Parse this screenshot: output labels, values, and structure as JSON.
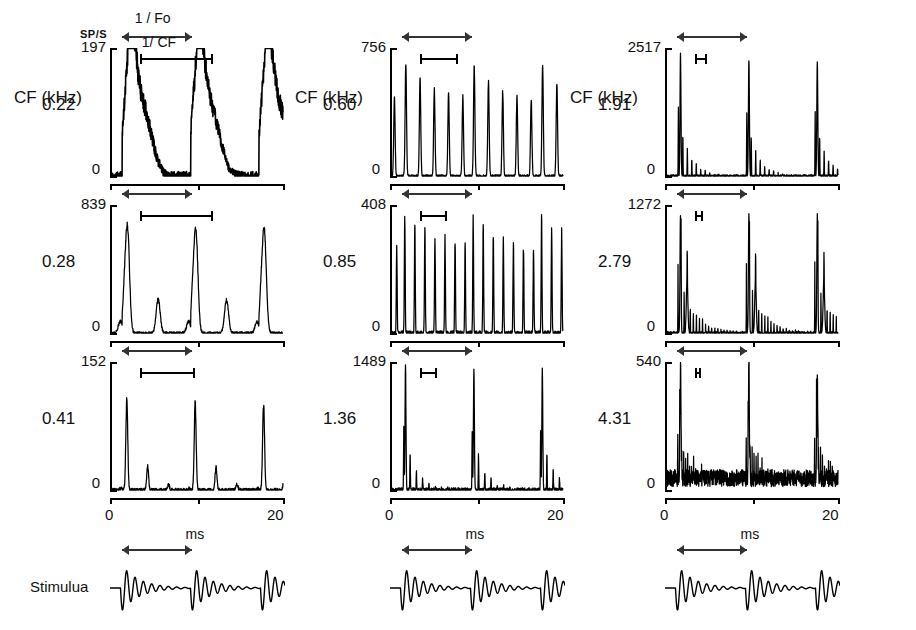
{
  "figure": {
    "yaxis_unit": "SP/S",
    "xaxis_unit": "ms",
    "xticks": [
      "0",
      "20"
    ],
    "xrange": [
      0,
      20
    ],
    "column_header": "CF (kHz)",
    "annotations": {
      "period_fo": "1 / Fo",
      "period_cf": "1/ CF"
    },
    "stimulus_label": "Stimulua",
    "zero_label": "0"
  },
  "chart_data": {
    "type": "line",
    "xlabel": "ms",
    "ylabel": "SP/S",
    "xlim": [
      0,
      20
    ],
    "grid": false,
    "legend": "none",
    "stimulus_period_ms": 8.0,
    "stimulus_onset_ms": 1.2,
    "panels": [
      {
        "row": 0,
        "col": 0,
        "cf_khz": "0.22",
        "cf_value": 0.22,
        "ymax_label": "197",
        "ymax": 197,
        "ymin_label": "0",
        "shape": "broad",
        "noise": 0.1,
        "decay": 0.05,
        "show_fo_label": true,
        "show_cf_label": true
      },
      {
        "row": 1,
        "col": 0,
        "cf_khz": "0.28",
        "cf_value": 0.28,
        "ymax_label": "839",
        "ymax": 839,
        "ymin_label": "0",
        "shape": "broad-peaks",
        "noise": 0.03,
        "decay": 0.3,
        "show_fo_label": false,
        "show_cf_label": false
      },
      {
        "row": 2,
        "col": 0,
        "cf_khz": "0.41",
        "cf_value": 0.41,
        "ymax_label": "152",
        "ymax": 152,
        "ymin_label": "0",
        "shape": "peaks",
        "noise": 0.04,
        "decay": 0.55,
        "show_fo_label": false,
        "show_cf_label": false
      },
      {
        "row": 0,
        "col": 1,
        "cf_khz": "0.60",
        "cf_value": 0.6,
        "ymax_label": "756",
        "ymax": 756,
        "ymin_label": "0",
        "shape": "comb",
        "noise": 0.03,
        "decay": 0.35,
        "show_fo_label": false,
        "show_cf_label": false
      },
      {
        "row": 1,
        "col": 1,
        "cf_khz": "0.85",
        "cf_value": 0.85,
        "ymax_label": "408",
        "ymax": 408,
        "ymin_label": "0",
        "shape": "comb-dense",
        "noise": 0.05,
        "decay": 0.18,
        "show_fo_label": false,
        "show_cf_label": false
      },
      {
        "row": 2,
        "col": 1,
        "cf_khz": "1.36",
        "cf_value": 1.36,
        "ymax_label": "1489",
        "ymax": 1489,
        "ymin_label": "0",
        "shape": "spikes",
        "noise": 0.05,
        "decay": 0.8,
        "show_fo_label": false,
        "show_cf_label": false
      },
      {
        "row": 0,
        "col": 2,
        "cf_khz": "1.91",
        "cf_value": 1.91,
        "ymax_label": "2517",
        "ymax": 2517,
        "ymin_label": "0",
        "shape": "spikes",
        "noise": 0.03,
        "decay": 0.85,
        "show_fo_label": false,
        "show_cf_label": false
      },
      {
        "row": 1,
        "col": 2,
        "cf_khz": "2.79",
        "cf_value": 2.79,
        "ymax_label": "1272",
        "ymax": 1272,
        "ymin_label": "0",
        "shape": "spikes-train",
        "noise": 0.03,
        "decay": 0.6,
        "show_fo_label": false,
        "show_cf_label": false
      },
      {
        "row": 2,
        "col": 2,
        "cf_khz": "4.31",
        "cf_value": 4.31,
        "ymax_label": "540",
        "ymax": 540,
        "ymin_label": "0",
        "shape": "spikes-noisy",
        "noise": 0.16,
        "decay": 0.9,
        "show_fo_label": false,
        "show_cf_label": false
      }
    ],
    "stimuli": [
      {
        "col": 0,
        "label": "Stimulua"
      },
      {
        "col": 1,
        "label": ""
      },
      {
        "col": 2,
        "label": ""
      }
    ]
  }
}
